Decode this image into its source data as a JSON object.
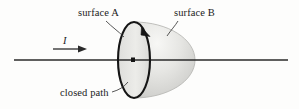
{
  "figure": {
    "background_color": "#fdfdfc",
    "ink_color": "#1b1b1b",
    "labels": {
      "surface_a": "surface A",
      "surface_b": "surface B",
      "closed_path": "closed path",
      "current": "I"
    },
    "elements": {
      "wire_name": "current-carrying-wire",
      "current_arrow_name": "current-direction-arrow",
      "loop_name": "closed-path-loop",
      "flat_surface_name": "surface-a-flat-disk",
      "dome_surface_name": "surface-b-dome",
      "circulation_arrow_name": "loop-circulation-arrow",
      "pierce_point_name": "wire-pierce-point"
    },
    "geometry": {
      "wire_y": 60,
      "wire_x_start": 14,
      "wire_x_end": 288,
      "loop_center_x": 134,
      "loop_center_y": 60,
      "loop_rx": 16,
      "loop_ry": 38,
      "dome_right_x": 195
    },
    "colors": {
      "surface_fill_light": "#f2f2f0",
      "surface_fill_mid": "#d9d9d6",
      "surface_fill_dark": "#c2c2bf",
      "outline": "#151515",
      "faint_outline": "#b9b9b6",
      "wire": "#2a2a2a"
    }
  }
}
